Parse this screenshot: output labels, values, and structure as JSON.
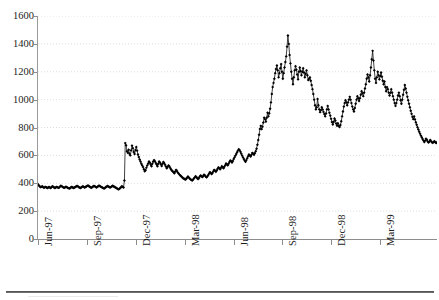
{
  "chart_data": {
    "type": "line",
    "title": "",
    "xlabel": "",
    "ylabel": "",
    "ylim": [
      0,
      1600
    ],
    "ytick_step": 200,
    "ytick_labels": [
      "1600",
      "1400",
      "1200",
      "1000",
      "800",
      "600",
      "400",
      "200",
      "0"
    ],
    "grid": "horizontal-dotted",
    "legend": "none",
    "marker": "filled-diamond",
    "line_color": "#111111",
    "marker_color": "#000000",
    "grid_color": "#cfcfcf",
    "axis_color": "#8d8d8d",
    "xtick_labels": [
      "Jun-97",
      "Sep-97",
      "Dec-97",
      "Mar-98",
      "Jun-98",
      "Sep-98",
      "Dec-98",
      "Mar-99"
    ],
    "x_range_start": "Jun-97",
    "x_range_end": "May-99",
    "series": [
      {
        "name": "price",
        "values": [
          393,
          385,
          378,
          372,
          374,
          378,
          372,
          368,
          371,
          374,
          370,
          366,
          369,
          373,
          370,
          366,
          372,
          378,
          374,
          369,
          366,
          370,
          374,
          371,
          367,
          370,
          376,
          382,
          379,
          374,
          370,
          367,
          371,
          375,
          372,
          368,
          365,
          362,
          366,
          371,
          374,
          370,
          366,
          369,
          373,
          377,
          381,
          378,
          373,
          369,
          366,
          369,
          374,
          378,
          374,
          370,
          373,
          377,
          381,
          384,
          380,
          375,
          371,
          368,
          372,
          377,
          381,
          378,
          374,
          370,
          374,
          379,
          383,
          380,
          376,
          372,
          369,
          365,
          362,
          366,
          371,
          376,
          380,
          377,
          373,
          369,
          372,
          377,
          382,
          379,
          375,
          371,
          368,
          364,
          360,
          356,
          360,
          366,
          372,
          378,
          374,
          370,
          420,
          688,
          672,
          630,
          618,
          640,
          612,
          600,
          636,
          670,
          652,
          624,
          610,
          638,
          660,
          634,
          606,
          588,
          570,
          556,
          540,
          528,
          516,
          500,
          486,
          494,
          512,
          528,
          542,
          556,
          548,
          534,
          522,
          540,
          556,
          566,
          558,
          546,
          534,
          522,
          540,
          556,
          548,
          536,
          524,
          540,
          552,
          544,
          532,
          520,
          508,
          516,
          528,
          522,
          510,
          500,
          492,
          486,
          478,
          472,
          484,
          496,
          488,
          478,
          470,
          462,
          456,
          450,
          444,
          438,
          434,
          430,
          426,
          432,
          440,
          448,
          442,
          434,
          428,
          424,
          420,
          426,
          434,
          442,
          450,
          444,
          436,
          430,
          438,
          448,
          456,
          450,
          444,
          452,
          462,
          456,
          448,
          442,
          450,
          460,
          470,
          480,
          474,
          466,
          474,
          486,
          496,
          490,
          482,
          492,
          504,
          514,
          508,
          500,
          510,
          522,
          516,
          508,
          518,
          530,
          542,
          536,
          528,
          540,
          552,
          564,
          558,
          548,
          560,
          574,
          586,
          598,
          610,
          622,
          634,
          644,
          638,
          626,
          612,
          598,
          586,
          574,
          562,
          554,
          566,
          580,
          594,
          606,
          600,
          592,
          604,
          618,
          612,
          604,
          616,
          630,
          648,
          676,
          710,
          748,
          790,
          812,
          788,
          806,
          836,
          870,
          860,
          842,
          870,
          906,
          880,
          902,
          934,
          980,
          1040,
          1090,
          1120,
          1150,
          1190,
          1220,
          1245,
          1210,
          1160,
          1190,
          1225,
          1255,
          1200,
          1150,
          1190,
          1230,
          1270,
          1310,
          1380,
          1460,
          1400,
          1320,
          1260,
          1200,
          1150,
          1110,
          1160,
          1210,
          1240,
          1215,
          1180,
          1145,
          1200,
          1230,
          1205,
          1175,
          1200,
          1225,
          1195,
          1160,
          1185,
          1210,
          1175,
          1140,
          1150,
          1160,
          1135,
          1105,
          1075,
          1040,
          1000,
          960,
          930,
          945,
          1005,
          960,
          930,
          910,
          925,
          945,
          930,
          912,
          896,
          880,
          900,
          930,
          955,
          930,
          905,
          885,
          862,
          840,
          822,
          840,
          865,
          850,
          828,
          812,
          830,
          812,
          804,
          818,
          845,
          880,
          915,
          950,
          975,
          995,
          980,
          960,
          980,
          1000,
          1020,
          1000,
          975,
          950,
          930,
          915,
          940,
          970,
          1000,
          1025,
          1010,
          990,
          1010,
          1035,
          1060,
          1045,
          1025,
          1050,
          1080,
          1110,
          1150,
          1180,
          1160,
          1130,
          1175,
          1230,
          1290,
          1350,
          1280,
          1210,
          1150,
          1120,
          1160,
          1200,
          1175,
          1145,
          1170,
          1195,
          1165,
          1135,
          1110,
          1130,
          1090,
          1060,
          1090,
          1075,
          1050,
          1030,
          1050,
          1075,
          1050,
          1025,
          1000,
          975,
          955,
          975,
          1000,
          1030,
          1050,
          1025,
          995,
          970,
          1000,
          1035,
          1070,
          1105,
          1080,
          1050,
          1020,
          995,
          970,
          945,
          920,
          898,
          876,
          860,
          880,
          858,
          838,
          820,
          802,
          786,
          770,
          756,
          742,
          730,
          718,
          706,
          696,
          706,
          720,
          712,
          700,
          692,
          700,
          710,
          702,
          694,
          690,
          696,
          702,
          694,
          688,
          694
        ]
      }
    ]
  },
  "axes": {
    "y_ticks": [
      {
        "label": "1600",
        "value": 1600
      },
      {
        "label": "1400",
        "value": 1400
      },
      {
        "label": "1200",
        "value": 1200
      },
      {
        "label": "1000",
        "value": 1000
      },
      {
        "label": "800",
        "value": 800
      },
      {
        "label": "600",
        "value": 600
      },
      {
        "label": "400",
        "value": 400
      },
      {
        "label": "200",
        "value": 200
      },
      {
        "label": "0",
        "value": 0
      }
    ],
    "x_ticks": [
      {
        "label": "Jun-97"
      },
      {
        "label": "Sep-97"
      },
      {
        "label": "Dec-97"
      },
      {
        "label": "Mar-98"
      },
      {
        "label": "Jun-98"
      },
      {
        "label": "Sep-98"
      },
      {
        "label": "Dec-98"
      },
      {
        "label": "Mar-99"
      }
    ]
  },
  "title_fragment": ""
}
